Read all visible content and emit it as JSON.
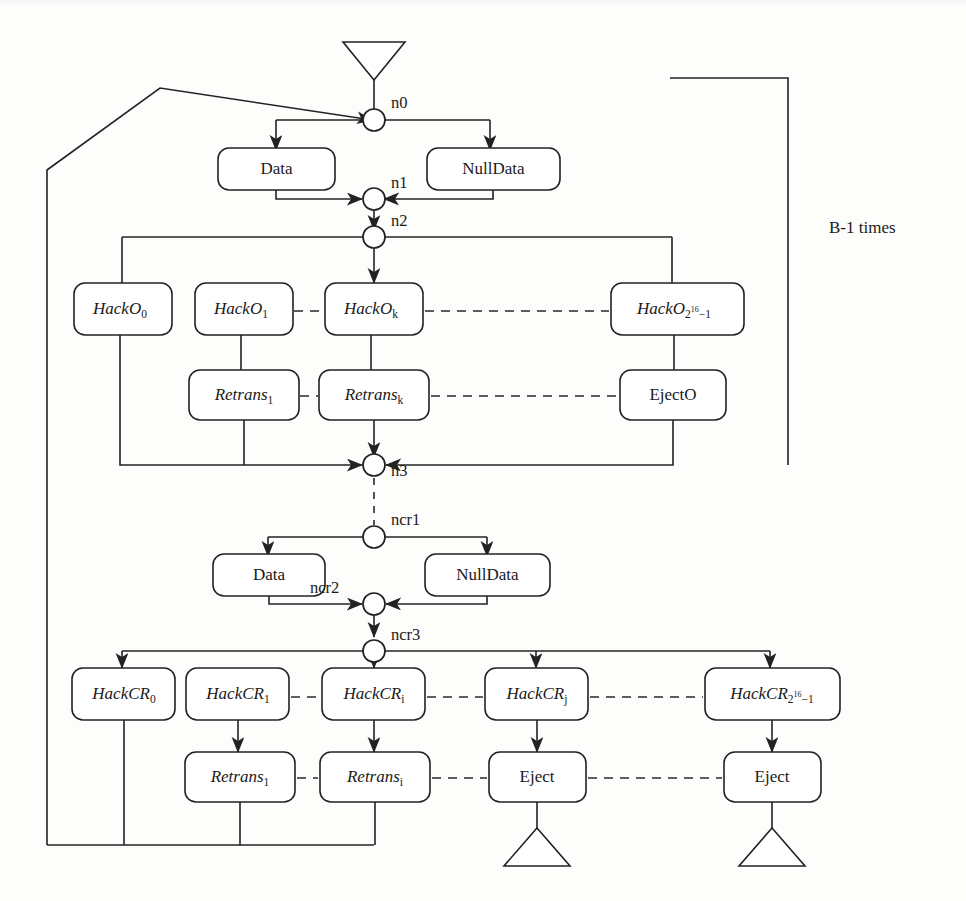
{
  "diagram": {
    "loop_label": "B-1 times",
    "nodes": [
      {
        "id": "n0",
        "label": "n0"
      },
      {
        "id": "n1",
        "label": "n1"
      },
      {
        "id": "n2",
        "label": "n2"
      },
      {
        "id": "n3",
        "label": "n3"
      },
      {
        "id": "ncr1",
        "label": "ncr1"
      },
      {
        "id": "ncr2",
        "label": "ncr2"
      },
      {
        "id": "ncr3",
        "label": "ncr3"
      }
    ],
    "stage_o": {
      "data_label": "Data",
      "nulldata_label": "NullData",
      "hack_boxes": [
        {
          "base": "HackO",
          "sub": "0"
        },
        {
          "base": "HackO",
          "sub": "1"
        },
        {
          "base": "HackO",
          "sub": "k"
        },
        {
          "base": "HackO",
          "sub": "2^16-1"
        }
      ],
      "retrans_boxes": [
        {
          "base": "Retrans",
          "sub": "1"
        },
        {
          "base": "Retrans",
          "sub": "k"
        }
      ],
      "eject_label": "EjectO"
    },
    "stage_cr": {
      "data_label": "Data",
      "nulldata_label": "NullData",
      "hack_boxes": [
        {
          "base": "HackCR",
          "sub": "0"
        },
        {
          "base": "HackCR",
          "sub": "1"
        },
        {
          "base": "HackCR",
          "sub": "i"
        },
        {
          "base": "HackCR",
          "sub": "j"
        },
        {
          "base": "HackCR",
          "sub": "2^16-1"
        }
      ],
      "retrans_boxes": [
        {
          "base": "Retrans",
          "sub": "1"
        },
        {
          "base": "Retrans",
          "sub": "i"
        }
      ],
      "eject_labels": [
        "Eject",
        "Eject"
      ]
    },
    "symbols": {
      "hacko_base": "HackO",
      "hackcr_base": "HackCR",
      "retrans_base": "Retrans",
      "two": "2",
      "exp16": "16",
      "minus1": "−1"
    },
    "colors": {
      "ink": "#222222",
      "paper": "#fdfdfc"
    }
  }
}
